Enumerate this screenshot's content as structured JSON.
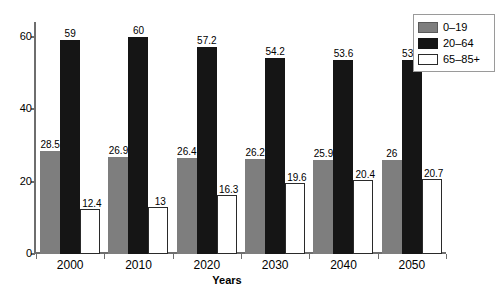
{
  "chart_data": {
    "type": "bar",
    "title": "",
    "xlabel": "Years",
    "ylabel": "",
    "categories": [
      "2000",
      "2010",
      "2020",
      "2030",
      "2040",
      "2050"
    ],
    "series": [
      {
        "name": "0–19",
        "color": "#7e7e7e",
        "values": [
          28.5,
          26.9,
          26.4,
          26.2,
          25.9,
          26
        ]
      },
      {
        "name": "20–64",
        "color": "#151515",
        "values": [
          59,
          60,
          57.2,
          54.2,
          53.6,
          53.4
        ]
      },
      {
        "name": "65–85+",
        "color": "#ffffff",
        "values": [
          12.4,
          13,
          16.3,
          19.6,
          20.4,
          20.7
        ]
      }
    ],
    "value_labels": [
      [
        "28.5",
        "59",
        "12.4"
      ],
      [
        "26.9",
        "60",
        "13"
      ],
      [
        "26.4",
        "57.2",
        "16.3"
      ],
      [
        "26.2",
        "54.2",
        "19.6"
      ],
      [
        "25.9",
        "53.6",
        "20.4"
      ],
      [
        "26",
        "53.4",
        "20.7"
      ]
    ],
    "ylim": [
      0,
      64
    ],
    "yticks": [
      0,
      20,
      40,
      60
    ],
    "ytick_labels": [
      "0",
      "20",
      "40",
      "60"
    ],
    "grid": false,
    "legend_position": "top-right",
    "axis_color": "#6e6e6e"
  },
  "legend": {
    "entries": [
      {
        "label": "0–19"
      },
      {
        "label": "20–64"
      },
      {
        "label": "65–85+"
      }
    ]
  }
}
